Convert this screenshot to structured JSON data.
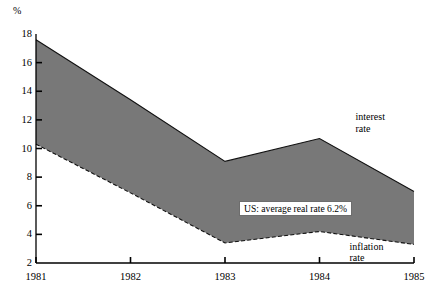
{
  "chart_data": {
    "type": "area",
    "title": "",
    "subtitle": "",
    "xlabel": "",
    "ylabel": "%",
    "unit_label": "%",
    "categories": [
      "1981",
      "1982",
      "1983",
      "1984",
      "1985"
    ],
    "x": [
      1981,
      1982,
      1983,
      1984,
      1985
    ],
    "xlim": [
      1981,
      1985
    ],
    "ylim": [
      2,
      18
    ],
    "ytick_step": 2,
    "yticks": [
      2,
      4,
      6,
      8,
      10,
      12,
      14,
      16,
      18
    ],
    "ytick_labels": [
      "2",
      "4",
      "6",
      "8",
      "10",
      "12",
      "14",
      "16",
      "18"
    ],
    "xticks": [
      1981,
      1982,
      1983,
      1984,
      1985
    ],
    "xtick_labels": [
      "1981",
      "1982",
      "1983",
      "1984",
      "1985"
    ],
    "grid": false,
    "legend_position": "inline-annotations",
    "series": [
      {
        "name": "interest rate",
        "label": "interest\nrate",
        "line_style": "solid",
        "values": [
          17.6,
          13.4,
          9.1,
          10.7,
          7.0
        ]
      },
      {
        "name": "inflation rate",
        "label": "inflation\nrate",
        "line_style": "dashed",
        "values": [
          10.3,
          6.9,
          3.4,
          4.2,
          3.3
        ]
      }
    ],
    "fill_between": {
      "upper": "interest rate",
      "lower": "inflation rate",
      "label": "real rate spread",
      "color": "#787878"
    },
    "annotations": [
      {
        "name": "average-real-rate-callout",
        "text": "US: average real rate 6.2%",
        "value": 6.2
      }
    ],
    "colors": {
      "band_fill": "#787878",
      "axis": "#000000",
      "background": "#ffffff",
      "callout_background": "#ffffff"
    }
  },
  "labels": {
    "interest_rate": "interest\nrate",
    "inflation_rate": "inflation\nrate",
    "callout": "US: average real rate 6.2%"
  }
}
